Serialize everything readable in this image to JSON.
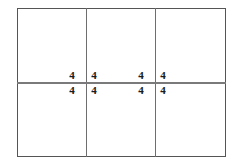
{
  "figure": {
    "type": "geometry-diagram",
    "canvas": {
      "width": 238,
      "height": 168,
      "background": "#ffffff"
    },
    "outer_rectangle": {
      "x": 17,
      "y": 8,
      "width": 209,
      "height": 149,
      "stroke": "#555555",
      "stroke_width": 1
    },
    "grid": {
      "columns": 3,
      "rows": 2,
      "vertical_dividers": [
        {
          "name": "vertical-divider-1",
          "x": 86,
          "stroke": "#6e6e6e",
          "stroke_width": 1
        },
        {
          "name": "vertical-divider-2",
          "x": 155,
          "stroke": "#6e6e6e",
          "stroke_width": 1
        }
      ],
      "horizontal_dividers": [
        {
          "name": "horizontal-divider-1",
          "y": 83,
          "stroke": "#7a7a7a",
          "stroke_width": 2
        }
      ]
    },
    "labels": {
      "left_cluster": {
        "intersection": {
          "x": 86,
          "y": 83
        },
        "top_left": "4",
        "top_right": "4",
        "bottom_left": "4",
        "bottom_right": "4"
      },
      "right_cluster": {
        "intersection": {
          "x": 155,
          "y": 83
        },
        "top_left": "4",
        "top_right": "4",
        "bottom_left": "4",
        "bottom_right": "4"
      }
    },
    "label_color": "#1a1a1a",
    "label_count": 8,
    "label_value": "4"
  }
}
